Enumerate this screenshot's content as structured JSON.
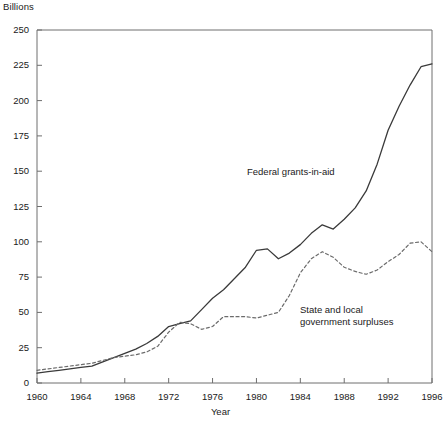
{
  "chart": {
    "unit_label": "Billions",
    "xlabel": "Year",
    "ylabel": "",
    "title": ""
  },
  "annotations": {
    "federal": "Federal grants-in-aid",
    "state": "State and local\ngovernment surpluses"
  },
  "colors": {
    "axis": "#6e6e6e",
    "federal_line": "#3a3a3a",
    "state_line": "#6b6b6b",
    "text": "#1a1a1a",
    "background": "#ffffff"
  },
  "chart_data": {
    "type": "line",
    "title": "",
    "xlabel": "Year",
    "ylabel": "Billions",
    "xlim": [
      1960,
      1996
    ],
    "ylim": [
      0,
      250
    ],
    "ytick_labels": [
      "0",
      "25",
      "50",
      "75",
      "100",
      "125",
      "150",
      "175",
      "200",
      "225",
      "250"
    ],
    "yticks": [
      0,
      25,
      50,
      75,
      100,
      125,
      150,
      175,
      200,
      225,
      250
    ],
    "xticks": [
      1960,
      1964,
      1968,
      1972,
      1976,
      1980,
      1984,
      1988,
      1992,
      1996
    ],
    "xtick_labels": [
      "1960",
      "1964",
      "1968",
      "1972",
      "1976",
      "1980",
      "1984",
      "1988",
      "1992",
      "1996"
    ],
    "grid": false,
    "legend": "inline-annotations",
    "x": [
      1960,
      1961,
      1962,
      1963,
      1964,
      1965,
      1966,
      1967,
      1968,
      1969,
      1970,
      1971,
      1972,
      1973,
      1974,
      1975,
      1976,
      1977,
      1978,
      1979,
      1980,
      1981,
      1982,
      1983,
      1984,
      1985,
      1986,
      1987,
      1988,
      1989,
      1990,
      1991,
      1992,
      1993,
      1994,
      1995,
      1996
    ],
    "series": [
      {
        "name": "Federal grants-in-aid",
        "style": "solid",
        "values": [
          7,
          8,
          9,
          10,
          11,
          12,
          15,
          18,
          21,
          24,
          28,
          33,
          40,
          42,
          44,
          52,
          60,
          66,
          74,
          82,
          94,
          95,
          88,
          92,
          98,
          106,
          112,
          109,
          116,
          124,
          136,
          155,
          179,
          196,
          211,
          224,
          226
        ]
      },
      {
        "name": "State and local government surpluses",
        "style": "dashed",
        "values": [
          9,
          10,
          11,
          12,
          13,
          14,
          16,
          18,
          19,
          20,
          22,
          26,
          36,
          43,
          42,
          38,
          40,
          47,
          47,
          47,
          46,
          48,
          50,
          62,
          78,
          88,
          93,
          89,
          82,
          79,
          77,
          80,
          86,
          91,
          99,
          100,
          93
        ]
      }
    ]
  }
}
